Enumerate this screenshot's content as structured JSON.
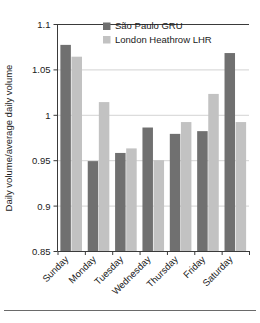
{
  "chart_data": {
    "type": "bar",
    "title": "",
    "xlabel": "",
    "ylabel": "Daily volume/average daily volume",
    "categories": [
      "Sunday",
      "Monday",
      "Tuesday",
      "Wednesday",
      "Thursday",
      "Friday",
      "Saturday"
    ],
    "series": [
      {
        "name": "São Paulo GRU",
        "color": "#707070",
        "values": [
          1.077,
          0.949,
          0.958,
          0.986,
          0.979,
          0.982,
          1.068
        ]
      },
      {
        "name": "London Heathrow LHR",
        "color": "#c2c2c2",
        "values": [
          1.064,
          1.014,
          0.963,
          0.95,
          0.992,
          1.023,
          0.992
        ]
      }
    ],
    "ylim": [
      0.85,
      1.1
    ],
    "yticks": [
      "0.85",
      "0.9",
      "0.95",
      "1",
      "1.05",
      "1.1"
    ],
    "ytick_values": [
      0.85,
      0.9,
      0.95,
      1.0,
      1.05,
      1.1
    ],
    "grid": true,
    "legend_position": "top-center"
  },
  "legend": {
    "items": [
      {
        "label": "São Paulo GRU",
        "swatch": "#707070"
      },
      {
        "label": "London Heathrow LHR",
        "swatch": "#c2c2c2"
      }
    ]
  },
  "colors": {
    "series_dark": "#707070",
    "series_light": "#c2c2c2",
    "axis": "#3a3a3a",
    "grid": "#c8c8c8",
    "background": "#ffffff"
  }
}
